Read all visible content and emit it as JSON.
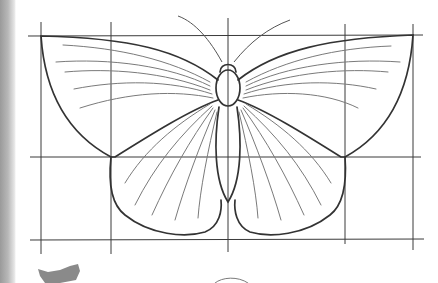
{
  "image": {
    "subject": "Pencil sketch of a butterfly drawn over a construction grid",
    "description": "Symmetric butterfly outline with forewings, hindwings, body, head and antennae, with veins radiating from the thorax; grid of 5 vertical and 3 horizontal guide lines",
    "colors": {
      "paper": "#ffffff",
      "pencil_dark": "#333333",
      "pencil_light": "#7a7a7a",
      "page_edge": "#a8a8a8"
    }
  }
}
